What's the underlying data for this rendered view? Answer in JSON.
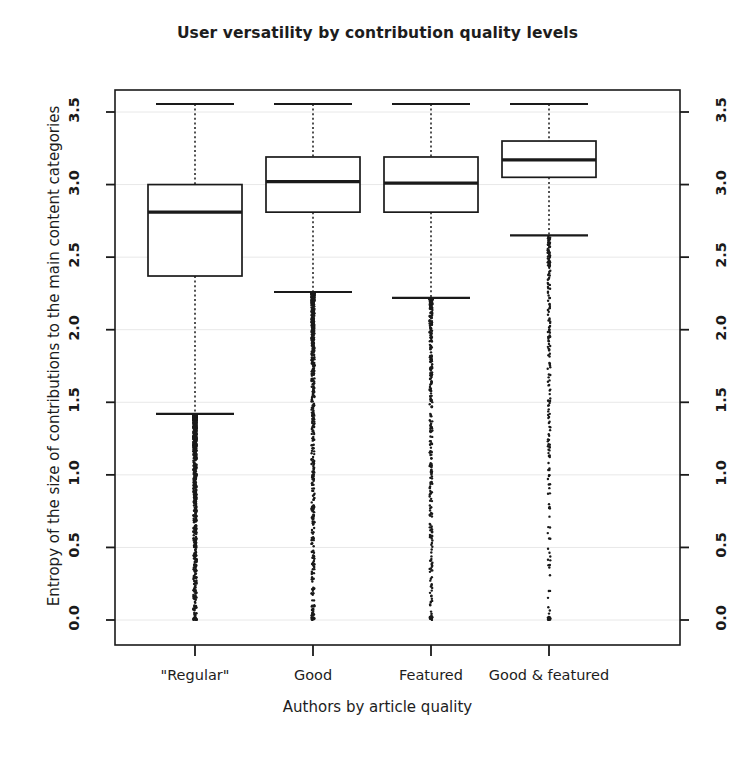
{
  "chart_data": {
    "type": "box",
    "title": "User versatility by contribution quality levels",
    "xlabel": "Authors by article quality",
    "ylabel": "Entropy of the size of contributions to the main content categories",
    "categories": [
      "\"Regular\"",
      "Good",
      "Featured",
      "Good & featured"
    ],
    "ylim": [
      0.0,
      3.63
    ],
    "yticks": [
      0.0,
      0.5,
      1.0,
      1.5,
      2.0,
      2.5,
      3.0,
      3.5
    ],
    "ytick_labels": [
      "0.0",
      "0.5",
      "1.0",
      "1.5",
      "2.0",
      "2.5",
      "3.0",
      "3.5"
    ],
    "right_axis": true,
    "right_ytick_labels": [
      "0.0",
      "0.5",
      "1.0",
      "1.5",
      "2.0",
      "2.5",
      "3.0",
      "3.5"
    ],
    "grid": true,
    "legend": null,
    "boxes": [
      {
        "name": "\"Regular\"",
        "whisker_low": 1.42,
        "q1": 2.37,
        "median": 2.81,
        "q3": 3.0,
        "whisker_high": 3.555,
        "outlier_min": 0.0,
        "outlier_max": 1.41,
        "outlier_density": "very-dense"
      },
      {
        "name": "Good",
        "whisker_low": 2.26,
        "q1": 2.81,
        "median": 3.02,
        "q3": 3.19,
        "whisker_high": 3.555,
        "outlier_min": 0.0,
        "outlier_max": 2.25,
        "outlier_density": "dense"
      },
      {
        "name": "Featured",
        "whisker_low": 2.22,
        "q1": 2.81,
        "median": 3.01,
        "q3": 3.19,
        "whisker_high": 3.555,
        "outlier_min": 0.0,
        "outlier_max": 2.21,
        "outlier_density": "medium"
      },
      {
        "name": "Good & featured",
        "whisker_low": 2.65,
        "q1": 3.05,
        "median": 3.17,
        "q3": 3.3,
        "whisker_high": 3.555,
        "outlier_min": 0.0,
        "outlier_max": 2.64,
        "outlier_density": "sparse"
      }
    ],
    "colors": {
      "line": "#1a1a1a",
      "background": "#ffffff",
      "grid": "#e8e8e8"
    }
  }
}
